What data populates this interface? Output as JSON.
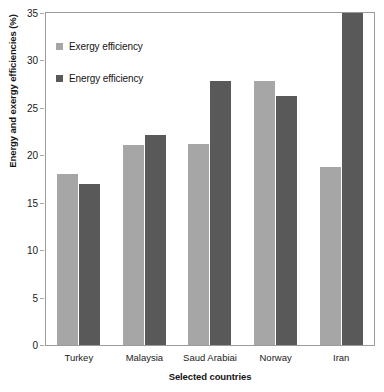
{
  "chart_data": {
    "type": "bar",
    "title": "",
    "xlabel": "Selected countries",
    "ylabel": "Energy and exergy efficiencies (%)",
    "categories": [
      "Turkey",
      "Malaysia",
      "Saud Arabiai",
      "Norway",
      "Iran"
    ],
    "series": [
      {
        "name": "Exergy efficiency",
        "color": "#a6a6a6",
        "values": [
          18.0,
          21.1,
          21.2,
          27.8,
          18.8
        ]
      },
      {
        "name": "Energy efficiency",
        "color": "#595959",
        "values": [
          17.0,
          22.1,
          27.8,
          26.2,
          35.0
        ]
      }
    ],
    "ylim": [
      0,
      35
    ],
    "yticks": [
      0,
      5,
      10,
      15,
      20,
      25,
      30,
      35
    ],
    "ytick_labels": [
      "0",
      "5",
      "10",
      "15",
      "20",
      "25",
      "30",
      "35"
    ],
    "grid": false,
    "legend_position": "upper-left"
  },
  "legend": {
    "items": [
      {
        "label": "Exergy efficiency",
        "color": "#a6a6a6"
      },
      {
        "label": "Energy efficiency",
        "color": "#595959"
      }
    ]
  },
  "axes": {
    "frame_color": "#9b9b9b",
    "tick_color": "#a8a8a8",
    "text_color": "#1a1a1a"
  }
}
